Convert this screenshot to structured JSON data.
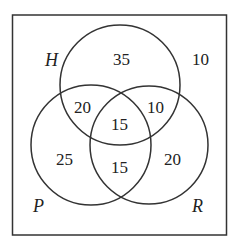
{
  "diagram": {
    "type": "venn-3-set",
    "sets": [
      {
        "id": "H",
        "label": "H"
      },
      {
        "id": "P",
        "label": "P"
      },
      {
        "id": "R",
        "label": "R"
      }
    ],
    "regions": {
      "outside": "10",
      "H_only": "35",
      "P_only": "25",
      "R_only": "20",
      "H_P_only": "20",
      "H_R_only": "10",
      "P_R_only": "15",
      "H_P_R": "15"
    },
    "colors": {
      "stroke": "#333333",
      "text": "#222222",
      "background": "#ffffff"
    }
  }
}
